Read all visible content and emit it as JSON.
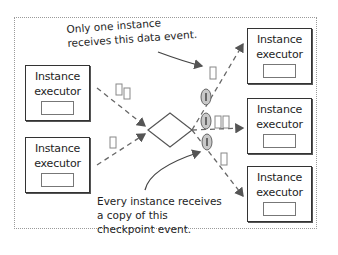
{
  "diagram": {
    "title": "",
    "upstream_executors": [
      {
        "id": "left-top",
        "label_line1": "Instance",
        "label_line2": "executor"
      },
      {
        "id": "left-bottom",
        "label_line1": "Instance",
        "label_line2": "executor"
      }
    ],
    "downstream_executors": [
      {
        "id": "right-top",
        "label_line1": "Instance",
        "label_line2": "executor"
      },
      {
        "id": "right-middle",
        "label_line1": "Instance",
        "label_line2": "executor"
      },
      {
        "id": "right-bottom",
        "label_line1": "Instance",
        "label_line2": "executor"
      }
    ],
    "router": {
      "shape": "diamond"
    },
    "annotations": {
      "data_event": {
        "line1": "Only one instance",
        "line2": "receives this data event."
      },
      "checkpoint_event": {
        "line1": "Every instance receives",
        "line2": "a copy of this",
        "line3": "checkpoint event."
      }
    },
    "checkpoint_marker_glyph": "I",
    "colors": {
      "stroke": "#333333",
      "frame": "#9a9a9a",
      "checkpoint_fill": "#c8c8c8"
    }
  }
}
